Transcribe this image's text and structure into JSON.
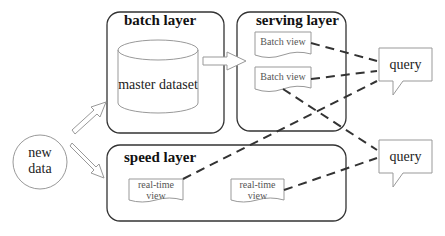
{
  "diagram": {
    "colors": {
      "stroke": "#333333",
      "light_stroke": "#999999",
      "background": "#ffffff"
    },
    "source": {
      "label_line1": "new",
      "label_line2": "data"
    },
    "batch_layer": {
      "title": "batch layer",
      "dataset": "master dataset"
    },
    "serving_layer": {
      "title": "serving layer",
      "views": [
        "Batch view",
        "Batch view"
      ]
    },
    "speed_layer": {
      "title": "speed layer",
      "views": [
        {
          "line1": "real-time",
          "line2": "view"
        },
        {
          "line1": "real-time",
          "line2": "view"
        }
      ]
    },
    "queries": [
      "query",
      "query"
    ],
    "edges": [
      {
        "from": "new data",
        "to": "batch layer",
        "style": "hollow-arrow"
      },
      {
        "from": "new data",
        "to": "speed layer",
        "style": "hollow-arrow"
      },
      {
        "from": "batch layer",
        "to": "serving layer",
        "style": "hollow-arrow"
      },
      {
        "from": "Batch view 1",
        "to": "query 1",
        "style": "dashed"
      },
      {
        "from": "Batch view 2",
        "to": "query 1",
        "style": "dashed"
      },
      {
        "from": "real-time view 1",
        "to": "query 1",
        "style": "dashed"
      },
      {
        "from": "Batch view 2",
        "to": "query 2",
        "style": "dashed"
      },
      {
        "from": "real-time view 2",
        "to": "query 2",
        "style": "dashed"
      }
    ]
  }
}
